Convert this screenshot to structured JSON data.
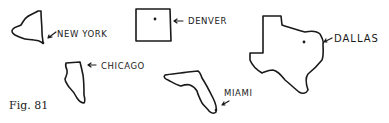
{
  "figure": {
    "caption": "Fig. 81",
    "items": [
      {
        "state": "New York",
        "city": "NEW YORK"
      },
      {
        "state": "Colorado",
        "city": "DENVER"
      },
      {
        "state": "Texas",
        "city": "DALLAS"
      },
      {
        "state": "Illinois",
        "city": "CHICAGO"
      },
      {
        "state": "Florida",
        "city": "MIAMI"
      }
    ]
  }
}
